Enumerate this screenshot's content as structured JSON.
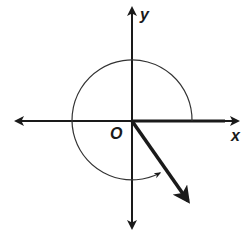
{
  "diagram": {
    "title": "",
    "type": "angle-in-standard-position",
    "labels": {
      "y_axis": "y",
      "x_axis": "x",
      "origin": "O"
    },
    "colors": {
      "ink": "#1a1a1a",
      "background": "#ffffff"
    },
    "geometry": {
      "origin": [
        132,
        121
      ],
      "x_axis": {
        "from": [
          14,
          121
        ],
        "to": [
          240,
          121
        ]
      },
      "y_axis": {
        "from": [
          132,
          6
        ],
        "to": [
          132,
          230
        ]
      },
      "circle_radius": 60,
      "initial_side": "positive x-axis",
      "terminal_ray": {
        "from": [
          132,
          121
        ],
        "to": [
          190,
          204
        ],
        "angle_deg": -55
      },
      "rotation_arc": {
        "direction": "counterclockwise",
        "start_deg": 0,
        "end_deg": 305,
        "arrowhead": true
      }
    }
  }
}
